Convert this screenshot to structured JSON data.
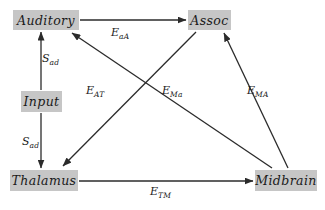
{
  "diagram": {
    "background_color": "#ffffff",
    "node_fill_color": "#c6c6c6",
    "line_color": "#2b2b2b",
    "nodes": [
      {
        "id": "auditory",
        "label": "Auditory"
      },
      {
        "id": "assoc",
        "label": "Assoc"
      },
      {
        "id": "input",
        "label": "Input"
      },
      {
        "id": "thalamus",
        "label": "Thalamus"
      },
      {
        "id": "midbrain",
        "label": "Midbrain"
      }
    ],
    "edges": [
      {
        "id": "eaa",
        "from": "auditory",
        "to": "assoc",
        "base": "E",
        "sub": "aA"
      },
      {
        "id": "sad-up",
        "from": "input",
        "to": "auditory",
        "base": "S",
        "sub": "ad"
      },
      {
        "id": "sad-down",
        "from": "input",
        "to": "thalamus",
        "base": "S",
        "sub": "ad"
      },
      {
        "id": "eat",
        "from": "assoc",
        "to": "thalamus",
        "base": "E",
        "sub": "AT"
      },
      {
        "id": "ema",
        "from": "midbrain",
        "to": "auditory",
        "base": "E",
        "sub": "Ma"
      },
      {
        "id": "emA",
        "from": "midbrain",
        "to": "assoc",
        "base": "E",
        "sub": "MA"
      },
      {
        "id": "etm",
        "from": "thalamus",
        "to": "midbrain",
        "base": "E",
        "sub": "TM"
      }
    ]
  }
}
